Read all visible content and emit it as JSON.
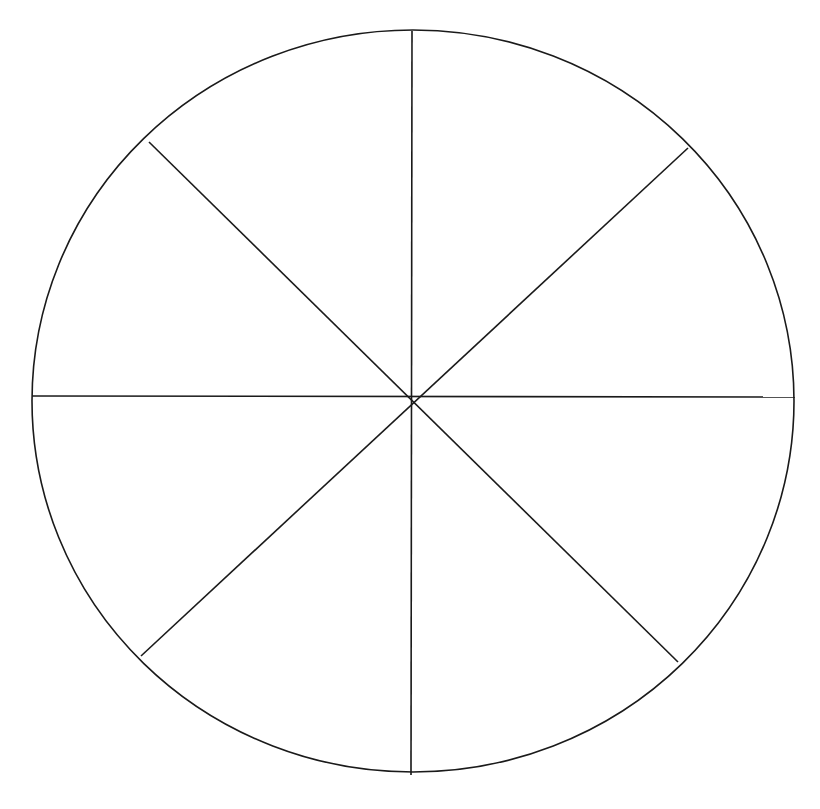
{
  "figure": {
    "type": "fraction-circle-diagram",
    "canvas": {
      "width": 820,
      "height": 809,
      "background_color": "#ffffff"
    },
    "style": {
      "stroke_color": "#1a1a1a",
      "stroke_width": 1.6,
      "fill_color": "none",
      "shaded_sector_count": 0
    },
    "circle": {
      "center_x": 413,
      "center_y": 401,
      "radius_x": 381,
      "radius_y": 371,
      "shape": "ellipse"
    },
    "divisions": {
      "sector_count": 8,
      "diameter_count": 4,
      "sector_angle_degrees": 45,
      "fraction_per_sector": "1/8"
    }
  },
  "chart_data": {
    "type": "pie",
    "title": "",
    "subtitle": "",
    "xlabel": "",
    "ylabel": "",
    "grid": false,
    "legend_position": "none",
    "labels": [
      "Sector 1",
      "Sector 2",
      "Sector 3",
      "Sector 4",
      "Sector 5",
      "Sector 6",
      "Sector 7",
      "Sector 8"
    ],
    "values": [
      12.5,
      12.5,
      12.5,
      12.5,
      12.5,
      12.5,
      12.5,
      12.5
    ],
    "value_unit": "percent",
    "fractions": [
      "1/8",
      "1/8",
      "1/8",
      "1/8",
      "1/8",
      "1/8",
      "1/8",
      "1/8"
    ],
    "slice_angles_degrees": [
      45,
      45,
      45,
      45,
      45,
      45,
      45,
      45
    ],
    "slice_fill_colors": [
      "none",
      "none",
      "none",
      "none",
      "none",
      "none",
      "none",
      "none"
    ],
    "annotations": []
  },
  "diameters": [
    {
      "name": "vertical-diameter",
      "angle_degrees": 90,
      "x1": 412,
      "y1": 31,
      "x2": 411,
      "y2": 775
    },
    {
      "name": "horizontal-diameter",
      "angle_degrees": 0,
      "x1": 32,
      "y1": 396,
      "x2": 795,
      "y2": 397
    },
    {
      "name": "diagonal-diameter-nwse",
      "angle_degrees": 135,
      "x1": 149,
      "y1": 142,
      "x2": 678,
      "y2": 662
    },
    {
      "name": "diagonal-diameter-nesw",
      "angle_degrees": 45,
      "x1": 688,
      "y1": 148,
      "x2": 141,
      "y2": 656
    }
  ],
  "sectors": [
    {
      "index": 1,
      "start_angle": 270,
      "end_angle": 315,
      "label": "",
      "filled": false
    },
    {
      "index": 2,
      "start_angle": 315,
      "end_angle": 360,
      "label": "",
      "filled": false
    },
    {
      "index": 3,
      "start_angle": 0,
      "end_angle": 45,
      "label": "",
      "filled": false
    },
    {
      "index": 4,
      "start_angle": 45,
      "end_angle": 90,
      "label": "",
      "filled": false
    },
    {
      "index": 5,
      "start_angle": 90,
      "end_angle": 135,
      "label": "",
      "filled": false
    },
    {
      "index": 6,
      "start_angle": 135,
      "end_angle": 180,
      "label": "",
      "filled": false
    },
    {
      "index": 7,
      "start_angle": 180,
      "end_angle": 225,
      "label": "",
      "filled": false
    },
    {
      "index": 8,
      "start_angle": 225,
      "end_angle": 270,
      "label": "",
      "filled": false
    }
  ]
}
